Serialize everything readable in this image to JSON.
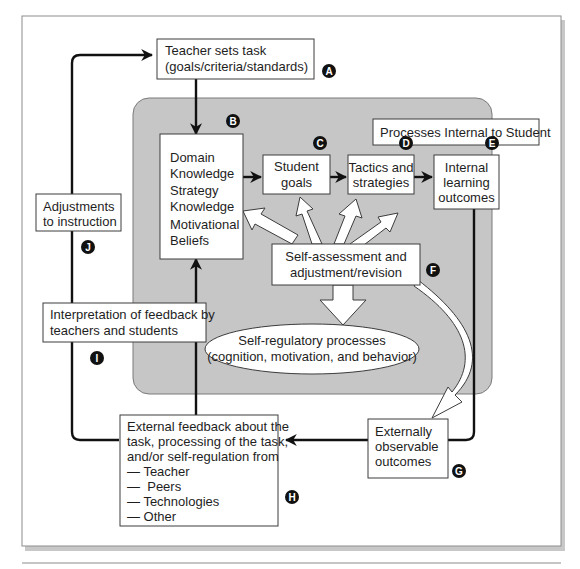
{
  "diagram": {
    "title_region": "Processes Internal to Student",
    "nodes": {
      "A": {
        "badge": "A",
        "lines": [
          "Teacher sets task",
          "(goals/criteria/standards)"
        ]
      },
      "B": {
        "badge": "B",
        "lines": [
          "Domain",
          "Knowledge",
          "Strategy",
          "Knowledge",
          "Motivational",
          "Beliefs"
        ]
      },
      "C": {
        "badge": "C",
        "lines": [
          "Student",
          "goals"
        ]
      },
      "D": {
        "badge": "D",
        "lines": [
          "Tactics and",
          "strategies"
        ]
      },
      "E": {
        "badge": "E",
        "lines": [
          "Internal",
          "learning",
          "outcomes"
        ]
      },
      "F": {
        "badge": "F",
        "lines": [
          "Self-assessment and",
          "adjustment/revision"
        ]
      },
      "SRP": {
        "lines": [
          "Self-regulatory processes",
          "(cognition, motivation, and behavior)"
        ]
      },
      "G": {
        "badge": "G",
        "lines": [
          "Externally",
          "observable",
          "outcomes"
        ]
      },
      "H": {
        "badge": "H",
        "lines": [
          "External feedback about the",
          "task, processing of the task,",
          "and/or self-regulation from",
          "— Teacher",
          "—  Peers",
          "— Technologies",
          "— Other"
        ]
      },
      "I": {
        "badge": "I",
        "lines": [
          "Interpretation of feedback by",
          "teachers and students"
        ]
      },
      "J": {
        "badge": "J",
        "lines": [
          "Adjustments",
          "to instruction"
        ]
      }
    },
    "edges": [
      {
        "from": "A",
        "to": "B",
        "style": "solid-arrow"
      },
      {
        "from": "B",
        "to": "C",
        "style": "solid-arrow"
      },
      {
        "from": "C",
        "to": "D",
        "style": "solid-arrow"
      },
      {
        "from": "D",
        "to": "E",
        "style": "solid-arrow"
      },
      {
        "from": "E",
        "to": "G",
        "style": "solid-line"
      },
      {
        "from": "G",
        "to": "H",
        "style": "solid-arrow"
      },
      {
        "from": "H",
        "to": "B",
        "style": "solid-arrow",
        "via": "I"
      },
      {
        "from": "H",
        "to": "A",
        "style": "solid-arrow",
        "via": "J"
      },
      {
        "from": "F",
        "to": "B",
        "style": "hollow-arrow"
      },
      {
        "from": "F",
        "to": "C",
        "style": "hollow-arrow"
      },
      {
        "from": "F",
        "to": "D",
        "style": "hollow-arrow"
      },
      {
        "from": "F",
        "to": "E",
        "style": "hollow-arrow"
      },
      {
        "from": "F",
        "to": "SRP",
        "style": "hollow-arrow"
      },
      {
        "from": "F",
        "to": "G",
        "style": "hollow-curved-arrow"
      }
    ],
    "colors": {
      "region_fill": "#c6c6c6",
      "badge_fill": "#111111",
      "line": "#111111"
    }
  }
}
